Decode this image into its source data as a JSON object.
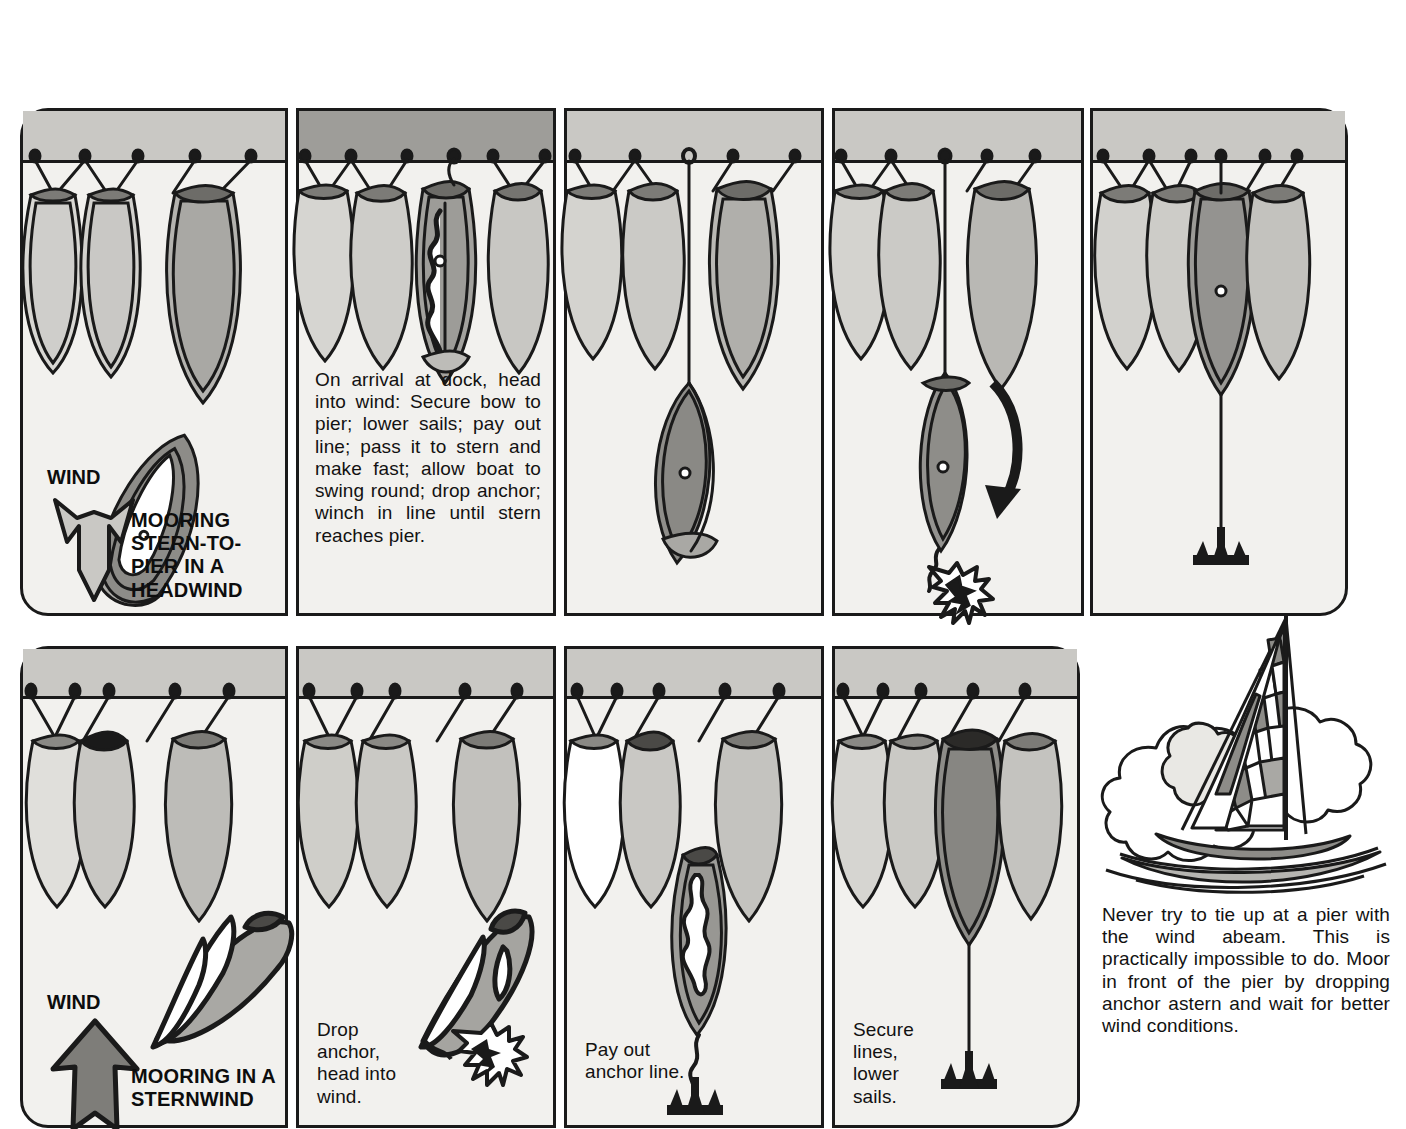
{
  "document": {
    "title": "Mooring Stern-to-Pier / Mooring in a Sternwind",
    "background_color": "#ffffff",
    "panel_fill": "#f2f1ee",
    "ink_color": "#1a1a1a",
    "pier_light": "#c9c8c4",
    "pier_dark": "#9e9d99",
    "hull_fill": "#c5c4c0",
    "hull_dark": "#8f8e8a",
    "sail_white": "#ffffff"
  },
  "rows": [
    {
      "name": "top-row",
      "panels": [
        {
          "id": "panel-1",
          "pier_shade": "light",
          "wind_word": "WIND",
          "wind_arrow": "arrow-down",
          "wind_arrow_fill": "#c9c8c4",
          "title": "MOORING\nSTERN-TO-\nPIER IN A\nHEADWIND",
          "caption": ""
        },
        {
          "id": "panel-2",
          "pier_shade": "dark",
          "wind_word": "",
          "wind_arrow": "",
          "title": "",
          "caption": "On arrival at dock, head into wind: Secure bow to pier; lower sails; pay out line; pass it to stern and make fast; allow boat to swing round; drop anchor; winch in line until stern reaches pier."
        },
        {
          "id": "panel-3",
          "pier_shade": "light",
          "wind_word": "",
          "wind_arrow": "",
          "title": "",
          "caption": ""
        },
        {
          "id": "panel-4",
          "pier_shade": "light",
          "wind_word": "",
          "wind_arrow": "",
          "title": "",
          "caption": ""
        },
        {
          "id": "panel-5",
          "pier_shade": "light",
          "wind_word": "",
          "wind_arrow": "",
          "title": "",
          "caption": ""
        }
      ]
    },
    {
      "name": "bottom-row",
      "panels": [
        {
          "id": "panel-6",
          "pier_shade": "light",
          "wind_word": "WIND",
          "wind_arrow": "arrow-up",
          "wind_arrow_fill": "#7e7d79",
          "title": "MOORING IN A\nSTERNWIND",
          "caption": ""
        },
        {
          "id": "panel-7",
          "pier_shade": "light",
          "wind_word": "",
          "wind_arrow": "",
          "title": "",
          "caption": "Drop\nanchor,\nhead into\nwind."
        },
        {
          "id": "panel-8",
          "pier_shade": "light",
          "wind_word": "",
          "wind_arrow": "",
          "title": "",
          "caption": "Pay out\nanchor line."
        },
        {
          "id": "panel-9",
          "pier_shade": "light",
          "wind_word": "",
          "wind_arrow": "",
          "title": "",
          "caption": "Secure\nlines,\nlower\nsails."
        }
      ]
    }
  ],
  "sidebar": {
    "illustration": "sailboat-in-clouds",
    "caption": "Never try to tie up at a pier with the wind abeam. This is practically impossible to do. Moor in front of the pier by dropping anchor astern and wait for better wind conditions."
  },
  "icons": {
    "wind_arrow_down": "arrow-down-icon",
    "wind_arrow_up": "arrow-up-icon",
    "rotation_arrow": "curved-rotation-arrow-icon",
    "anchor": "anchor-icon",
    "splash": "splash-burst-icon",
    "mooring_post": "mooring-post-icon",
    "boat_top": "boat-top-view-icon",
    "sailboat": "sailboat-icon",
    "cloud": "cloud-icon"
  }
}
